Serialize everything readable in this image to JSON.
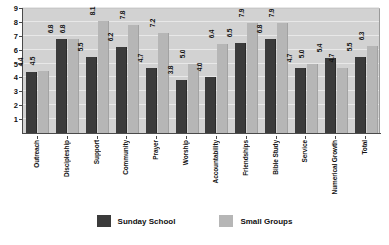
{
  "chart_data": {
    "type": "bar",
    "title": "",
    "subtitle": "",
    "xlabel": "",
    "ylabel": "",
    "ylim": [
      0,
      9
    ],
    "yticks": [
      0,
      1,
      2,
      3,
      4,
      5,
      6,
      7,
      8,
      9
    ],
    "grid": true,
    "legend_position": "bottom",
    "categories": [
      "Outreach",
      "Discipleship",
      "Support",
      "Community",
      "Prayer",
      "Worship",
      "Accountability",
      "Friendships",
      "Bible Study",
      "Service",
      "Numerical Growth",
      "Total"
    ],
    "series": [
      {
        "name": "Sunday School",
        "color": "#3b3b3b",
        "values": [
          4.4,
          6.8,
          5.5,
          6.2,
          4.7,
          3.8,
          4.0,
          6.5,
          6.8,
          4.7,
          5.4,
          5.5
        ],
        "labels": [
          "4.4",
          "6.8",
          "5.5",
          "6.2",
          "4.7",
          "3.8",
          "4.0",
          "6.5",
          "6.8",
          "4.7",
          "5.4",
          "5.5"
        ]
      },
      {
        "name": "Small Groups",
        "color": "#b6b6b6",
        "values": [
          4.5,
          6.8,
          8.1,
          7.8,
          7.2,
          5.0,
          6.4,
          7.9,
          7.9,
          5.0,
          4.7,
          6.3
        ],
        "labels": [
          "4.5",
          "6.8",
          "8.1",
          "7.8",
          "7.2",
          "5.0",
          "6.4",
          "7.9",
          "7.9",
          "5.0",
          "4.7",
          "6.3"
        ]
      }
    ]
  },
  "legend": {
    "items": [
      {
        "label": "Sunday School",
        "swatch": "dark"
      },
      {
        "label": "Small Groups",
        "swatch": "light"
      }
    ]
  },
  "colors": {
    "plot_background": "#d2d2d2",
    "gridline": "#e8e8e8",
    "axis": "#4a4a4a",
    "series_sunday_school": "#3b3b3b",
    "series_small_groups": "#b6b6b6",
    "text": "#111111"
  }
}
